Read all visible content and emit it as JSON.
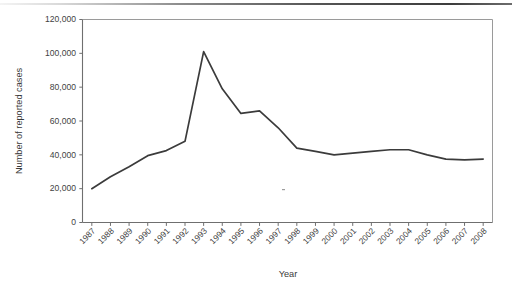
{
  "figure": {
    "top_rule_present": true
  },
  "chart_data": {
    "type": "line",
    "title": "",
    "xlabel": "Year",
    "ylabel": "Number of reported cases",
    "categories": [
      "1987",
      "1988",
      "1989",
      "1990",
      "1991",
      "1992",
      "1993",
      "1994",
      "1995",
      "1996",
      "1997",
      "1998",
      "1999",
      "2000",
      "2001",
      "2002",
      "2003",
      "2004",
      "2005",
      "2006",
      "2007",
      "2008"
    ],
    "values": [
      20000,
      27000,
      33000,
      39500,
      42500,
      48000,
      101000,
      79000,
      64500,
      66000,
      56000,
      44000,
      42000,
      40000,
      41000,
      42000,
      43000,
      43000,
      40000,
      37500,
      37000,
      37500
    ],
    "series": [
      {
        "name": "Number of reported cases",
        "values": [
          20000,
          27000,
          33000,
          39500,
          42500,
          48000,
          101000,
          79000,
          64500,
          66000,
          56000,
          44000,
          42000,
          40000,
          41000,
          42000,
          43000,
          43000,
          40000,
          37500,
          37000,
          37500
        ]
      }
    ],
    "ylim": [
      0,
      120000
    ],
    "ytick_values": [
      0,
      20000,
      40000,
      60000,
      80000,
      100000,
      120000
    ],
    "ytick_labels": [
      "0",
      "20,000",
      "40,000",
      "60,000",
      "80,000",
      "100,000",
      "120,000"
    ],
    "grid": false,
    "legend": null,
    "legend_position": "none",
    "line_color": "#3b3b3b",
    "axis_color": "#6f6f6f",
    "xtick_label_rotation": -45
  }
}
